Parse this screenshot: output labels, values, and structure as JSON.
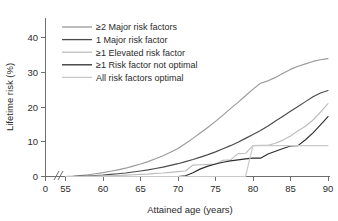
{
  "chart_data": {
    "type": "line",
    "title": "",
    "xlabel": "Attained age (years)",
    "ylabel": "Lifetime risk (%)",
    "xlim": [
      55,
      90
    ],
    "ylim": [
      0,
      44
    ],
    "xticks": [
      "0",
      "55",
      "60",
      "65",
      "70",
      "75",
      "80",
      "85",
      "90"
    ],
    "yticks": [
      "0",
      "10",
      "20",
      "30",
      "40"
    ],
    "x_axis_break": true,
    "grid": false,
    "legend_position": "upper-left",
    "x": [
      55,
      56,
      57,
      58,
      59,
      60,
      61,
      62,
      63,
      64,
      65,
      66,
      67,
      68,
      69,
      70,
      71,
      72,
      73,
      74,
      75,
      76,
      77,
      78,
      79,
      80,
      81,
      82,
      83,
      84,
      85,
      86,
      87,
      88,
      89,
      90
    ],
    "series": [
      {
        "name": "≥2 Major risk factors",
        "color": "#9a9a9a",
        "values": [
          0.0,
          0.1,
          0.3,
          0.5,
          0.8,
          1.1,
          1.5,
          1.9,
          2.4,
          3.0,
          3.6,
          4.3,
          5.1,
          6.0,
          7.0,
          8.1,
          9.5,
          11.0,
          12.6,
          14.2,
          15.9,
          17.7,
          19.6,
          21.4,
          23.3,
          25.2,
          26.9,
          27.6,
          28.6,
          29.8,
          30.9,
          31.8,
          32.5,
          33.2,
          33.7,
          34.0
        ]
      },
      {
        "name": "1 Major risk factor",
        "color": "#4a4a4a",
        "values": [
          0.0,
          0.0,
          0.1,
          0.2,
          0.3,
          0.4,
          0.6,
          0.8,
          1.0,
          1.3,
          1.6,
          1.9,
          2.3,
          2.7,
          3.2,
          3.7,
          4.3,
          4.9,
          5.6,
          6.3,
          7.1,
          8.0,
          8.9,
          9.9,
          11.0,
          12.1,
          13.3,
          14.6,
          16.0,
          17.4,
          18.8,
          20.2,
          21.6,
          23.0,
          24.1,
          24.8
        ]
      },
      {
        "name": "≥1 Elevated risk factor",
        "color": "#bdbdbd",
        "values": [
          0.0,
          0.0,
          0.0,
          0.1,
          0.1,
          0.2,
          0.2,
          0.3,
          0.4,
          0.5,
          0.6,
          0.7,
          0.9,
          1.0,
          1.2,
          1.4,
          1.6,
          3.3,
          3.4,
          3.5,
          3.6,
          4.7,
          4.8,
          6.6,
          6.7,
          8.9,
          9.0,
          9.0,
          9.6,
          10.5,
          11.7,
          13.2,
          14.5,
          16.3,
          18.6,
          21.0
        ]
      },
      {
        "name": "≥1 Risk factor not optimal",
        "color": "#2e2e2e",
        "values": [
          0.0,
          0.0,
          0.0,
          0.0,
          0.0,
          0.0,
          0.0,
          0.0,
          0.0,
          0.0,
          0.0,
          0.0,
          0.0,
          0.0,
          0.0,
          0.0,
          0.2,
          1.1,
          2.2,
          3.0,
          3.6,
          4.1,
          4.5,
          4.8,
          5.1,
          5.3,
          5.3,
          6.5,
          7.3,
          8.1,
          8.8,
          8.9,
          10.6,
          12.6,
          14.9,
          17.3
        ]
      },
      {
        "name": "All risk factors optimal",
        "color": "#c9c9c9",
        "values": [
          0.0,
          0.0,
          0.0,
          0.0,
          0.0,
          0.0,
          0.0,
          0.0,
          0.0,
          0.0,
          0.0,
          0.0,
          0.0,
          0.0,
          0.0,
          0.0,
          0.0,
          0.0,
          0.0,
          0.0,
          0.0,
          0.0,
          0.0,
          0.0,
          0.0,
          8.9,
          8.9,
          8.9,
          8.9,
          8.9,
          8.9,
          8.9,
          8.9,
          8.9,
          8.9,
          8.9
        ]
      }
    ]
  },
  "legend": {
    "items": [
      {
        "label": "≥2 Major risk factors"
      },
      {
        "label": "1 Major risk factor"
      },
      {
        "label": "≥1 Elevated risk factor"
      },
      {
        "label": "≥1 Risk factor not optimal"
      },
      {
        "label": "All risk factors optimal"
      }
    ]
  },
  "axes": {
    "x_title": "Attained age (years)",
    "y_title": "Lifetime risk (%)"
  }
}
